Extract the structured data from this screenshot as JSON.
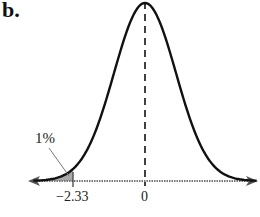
{
  "panel_label": "b.",
  "chart_data": {
    "type": "area",
    "title": "",
    "xlabel": "",
    "ylabel": "",
    "tick_labels": [
      "−2.33",
      "0"
    ],
    "ticks": [
      -2.33,
      0
    ],
    "xlim": [
      -3.6,
      3.6
    ],
    "shaded_region": {
      "from": "-inf",
      "to": -2.33,
      "area_label": "1%",
      "color": "#a9a9a9"
    },
    "mean_line": {
      "x": 0,
      "style": "dashed"
    },
    "annotations": [
      "1%"
    ],
    "grid": false,
    "legend": "none",
    "axis_arrows": true
  },
  "labels": {
    "tail_percent": "1%",
    "tick_left": "−2.33",
    "tick_center": "0"
  },
  "colors": {
    "curve": "#111111",
    "shade": "#a9a9a9",
    "axis": "#555555"
  }
}
